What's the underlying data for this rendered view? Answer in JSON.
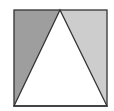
{
  "diagram": {
    "type": "geometry",
    "square": {
      "x": 14,
      "y": 10,
      "width": 93,
      "height": 96,
      "stroke": "#333333"
    },
    "triangle": {
      "apex": [
        60,
        10
      ],
      "base_left": [
        14,
        106
      ],
      "base_right": [
        107,
        106
      ],
      "fill": "#ffffff",
      "stroke": "#333333"
    },
    "shaded_left": {
      "fill": "#9e9e9e"
    },
    "shaded_right": {
      "fill": "#cdcdcd"
    }
  }
}
